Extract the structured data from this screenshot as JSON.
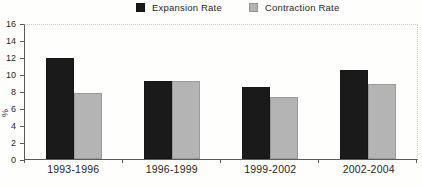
{
  "chart_data": {
    "type": "bar",
    "title": "",
    "xlabel": "",
    "ylabel": "%",
    "categories": [
      "1993-1996",
      "1996-1999",
      "1999-2002",
      "2002-2004"
    ],
    "series": [
      {
        "name": "Expansion Rate",
        "color": "#1a1a1a",
        "values": [
          11.9,
          9.2,
          8.5,
          10.5
        ]
      },
      {
        "name": "Contraction Rate",
        "color": "#b4b4b4",
        "values": [
          7.8,
          9.2,
          7.3,
          8.8
        ]
      }
    ],
    "ylim": [
      0,
      16
    ],
    "ytick_step": 2,
    "legend_position": "top",
    "grid": false,
    "axis_color": "#5a5a5a",
    "frame_color": "#c9c9c6"
  }
}
